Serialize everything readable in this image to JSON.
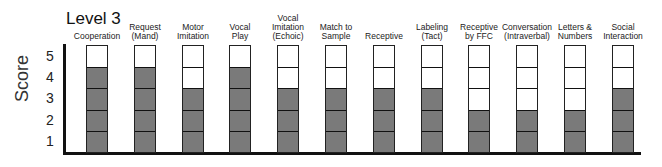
{
  "chart_data": {
    "type": "bar",
    "title": "Level 3",
    "xlabel": "",
    "ylabel": "Score",
    "ylim": [
      0,
      5
    ],
    "yticks": [
      "1",
      "2",
      "3",
      "4",
      "5"
    ],
    "grid": false,
    "legend": null,
    "categories": [
      "Cooperation",
      "Request (Mand)",
      "Motor Imitation",
      "Vocal Play",
      "Vocal Imitation (Echoic)",
      "Match to Sample",
      "Receptive",
      "Labeling (Tact)",
      "Receptive by FFC",
      "Conversation (Intraverbal)",
      "Letters & Numbers",
      "Social Interaction"
    ],
    "category_lines": [
      [
        "Cooperation"
      ],
      [
        "Request",
        "(Mand)"
      ],
      [
        "Motor",
        "Imitation"
      ],
      [
        "Vocal",
        "Play"
      ],
      [
        "Vocal",
        "Imitation",
        "(Echoic)"
      ],
      [
        "Match to",
        "Sample"
      ],
      [
        "Receptive"
      ],
      [
        "Labeling",
        "(Tact)"
      ],
      [
        "Receptive",
        "by FFC"
      ],
      [
        "Conversation",
        "(Intraverbal)"
      ],
      [
        "Letters &",
        "Numbers"
      ],
      [
        "Social",
        "Interaction"
      ]
    ],
    "values": [
      4,
      4,
      3,
      4,
      3,
      3,
      3,
      3,
      2,
      2,
      2,
      3
    ],
    "max": 5,
    "fill_color": "#7a7a7a"
  }
}
